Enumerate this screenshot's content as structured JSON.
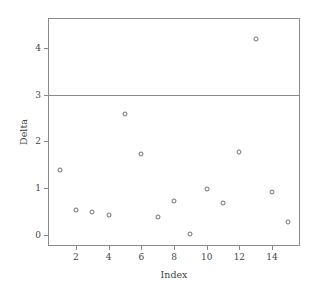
{
  "chart_data": {
    "type": "scatter",
    "title": "",
    "xlabel": "Index",
    "ylabel": "Delta",
    "x": [
      1,
      2,
      3,
      4,
      5,
      6,
      7,
      8,
      9,
      10,
      11,
      12,
      13,
      14,
      15
    ],
    "values": [
      1.38,
      0.52,
      0.48,
      0.42,
      2.58,
      1.72,
      0.38,
      0.73,
      0.02,
      0.98,
      0.68,
      1.78,
      4.2,
      0.92,
      0.28
    ],
    "series": [
      {
        "name": "Delta",
        "values": [
          1.38,
          0.52,
          0.48,
          0.42,
          2.58,
          1.72,
          0.38,
          0.73,
          0.02,
          0.98,
          0.68,
          1.78,
          4.2,
          0.92,
          0.28
        ]
      }
    ],
    "xlim": [
      0.35,
      15.65
    ],
    "ylim": [
      -0.22,
      4.62
    ],
    "xticks": [
      2,
      4,
      6,
      8,
      10,
      12,
      14
    ],
    "xtick_labels": [
      "2",
      "4",
      "6",
      "8",
      "10",
      "12",
      "14"
    ],
    "yticks": [
      0,
      1,
      2,
      3,
      4
    ],
    "ytick_labels": [
      "0",
      "1",
      "2",
      "3",
      "4"
    ],
    "grid": false,
    "legend": null,
    "marker": "open-circle",
    "reference_lines": [
      {
        "name": "threshold",
        "orientation": "horizontal",
        "value": 3,
        "color": "#8a8a8a"
      }
    ],
    "colors": {
      "marker_edge": "#6e6e6e",
      "frame": "#8a8a8a",
      "text": "#444444",
      "background": "#ffffff"
    }
  }
}
